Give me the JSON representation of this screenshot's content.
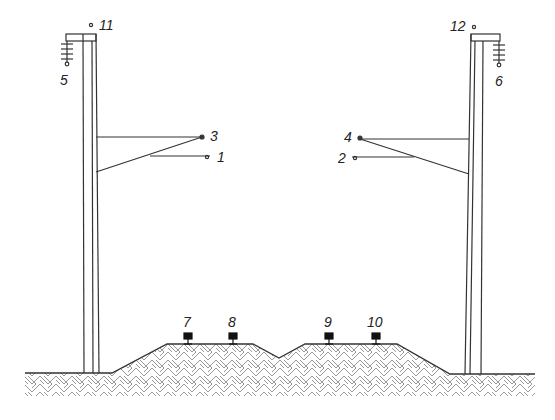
{
  "diagram": {
    "type": "railway-catenary-cross-section",
    "colors": {
      "line": "#333333",
      "hatch": "#9a9a9a",
      "background": "#ffffff"
    },
    "poles": [
      {
        "id": "left-pole",
        "insulator_label": "5",
        "top_point_label": "11"
      },
      {
        "id": "right-pole",
        "insulator_label": "6",
        "top_point_label": "12"
      }
    ],
    "cantilevers": {
      "left": {
        "upper_point_label": "3",
        "lower_point_label": "1"
      },
      "right": {
        "upper_point_label": "4",
        "lower_point_label": "2"
      }
    },
    "rails": [
      {
        "label": "7"
      },
      {
        "label": "8"
      },
      {
        "label": "9"
      },
      {
        "label": "10"
      }
    ],
    "labels": {
      "l1": "1",
      "l2": "2",
      "l3": "3",
      "l4": "4",
      "l5": "5",
      "l6": "6",
      "l7": "7",
      "l8": "8",
      "l9": "9",
      "l10": "10",
      "l11": "11",
      "l12": "12"
    }
  }
}
